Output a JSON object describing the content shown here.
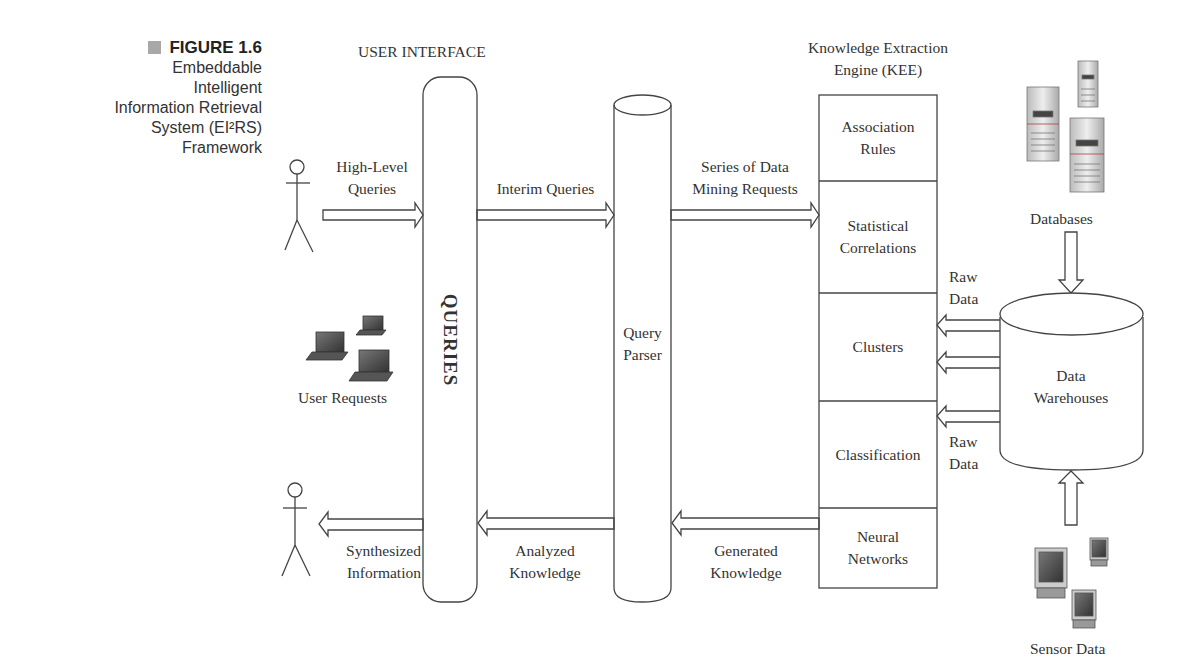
{
  "figure": {
    "number_label": "FIGURE 1.6",
    "caption_lines": [
      "Embeddable",
      "Intelligent",
      "Information Retrieval",
      "System (EI²RS)",
      "Framework"
    ]
  },
  "headers": {
    "user_interface": "USER INTERFACE",
    "kee_line1": "Knowledge Extraction",
    "kee_line2": "Engine (KEE)"
  },
  "user_interface": {
    "label": "QUERIES"
  },
  "query_parser": {
    "line1": "Query",
    "line2": "Parser"
  },
  "kee_modules": [
    {
      "line1": "Association",
      "line2": "Rules"
    },
    {
      "line1": "Statistical",
      "line2": "Correlations"
    },
    {
      "line1": "Clusters",
      "line2": ""
    },
    {
      "line1": "Classification",
      "line2": ""
    },
    {
      "line1": "Neural",
      "line2": "Networks"
    }
  ],
  "flows": {
    "high_level": {
      "line1": "High-Level",
      "line2": "Queries"
    },
    "interim": {
      "line1": "Interim Queries"
    },
    "mining": {
      "line1": "Series of Data",
      "line2": "Mining Requests"
    },
    "generated": {
      "line1": "Generated",
      "line2": "Knowledge"
    },
    "analyzed": {
      "line1": "Analyzed",
      "line2": "Knowledge"
    },
    "synthesized": {
      "line1": "Synthesized",
      "line2": "Information"
    },
    "raw_top": {
      "line1": "Raw",
      "line2": "Data"
    },
    "raw_bottom": {
      "line1": "Raw",
      "line2": "Data"
    }
  },
  "sources": {
    "user_requests": "User Requests",
    "databases": "Databases",
    "data_warehouse": {
      "line1": "Data",
      "line2": "Warehouses"
    },
    "sensor_data": "Sensor Data"
  },
  "icons": {
    "user_top": "stick-figure-icon",
    "user_bottom": "stick-figure-icon",
    "laptops": "laptop-icon",
    "servers": "server-tower-icon",
    "monitors": "desktop-computer-icon"
  },
  "colors": {
    "stroke": "#444444",
    "text": "#333333",
    "caption_square": "#a8a8a8"
  }
}
